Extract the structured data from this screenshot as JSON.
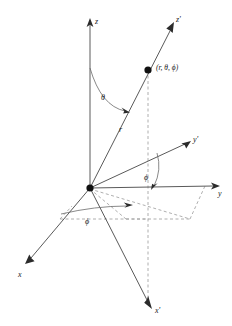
{
  "figure": {
    "background_color": "#ffffff",
    "line_color": "#5a5a5a",
    "dash_color": "#9a9a9a",
    "label_color": "#1a1a1a",
    "width": 232,
    "height": 326
  },
  "axes": [
    {
      "id": "z",
      "label": "z",
      "primed": false,
      "description": "vertical axis pointing up"
    },
    {
      "id": "y",
      "label": "y",
      "primed": false,
      "description": "horizontal axis pointing right"
    },
    {
      "id": "x",
      "label": "x",
      "primed": false,
      "description": "axis pointing down-left toward viewer"
    },
    {
      "id": "zprime",
      "label": "z'",
      "primed": true,
      "description": "rotated vertical axis pointing up-right"
    },
    {
      "id": "yprime",
      "label": "y'",
      "primed": true,
      "description": "rotated horizontal axis pointing up-right"
    },
    {
      "id": "xprime",
      "label": "x'",
      "primed": true,
      "description": "rotated axis pointing down-right"
    }
  ],
  "labels": {
    "z": "z",
    "y": "y",
    "x": "x",
    "z_prime": "z'",
    "y_prime": "y'",
    "x_prime": "x'",
    "radius": "r",
    "theta": "θ",
    "phi_upper": "ϕ",
    "phi_lower": "ϕ",
    "point": "(r, θ, ϕ)"
  },
  "markers": {
    "origin_name": "origin",
    "point_name": "point-r-theta-phi"
  },
  "annotations": {
    "theta_description": "polar angle measured from the z axis down to the radius vector r",
    "phi_description": "azimuthal angle measured in the horizontal plane from the y axis",
    "r_description": "radial distance from the origin to the point"
  }
}
